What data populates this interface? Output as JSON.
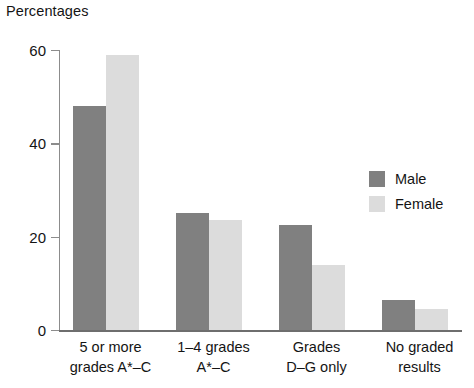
{
  "chart_data": {
    "type": "bar",
    "title": "Percentages",
    "xlabel": "",
    "ylabel": "Percentages",
    "ylim": [
      0,
      60
    ],
    "yticks": [
      0,
      20,
      40,
      60
    ],
    "ytick_labels": [
      "0",
      "20",
      "40",
      "60"
    ],
    "grid": false,
    "legend_position": "right",
    "categories": [
      "5 or more grades A*–C",
      "1–4 grades A*–C",
      "Grades D–G only",
      "No graded results"
    ],
    "category_lines": [
      [
        "5 or more",
        "grades A*–C"
      ],
      [
        "1–4 grades",
        "A*–C"
      ],
      [
        "Grades",
        "D–G only"
      ],
      [
        "No graded",
        "results"
      ]
    ],
    "series": [
      {
        "name": "Male",
        "color": "#808080",
        "values": [
          48,
          25,
          22.5,
          6.5
        ]
      },
      {
        "name": "Female",
        "color": "#dcdcdc",
        "values": [
          59,
          23.5,
          14,
          4.5
        ]
      }
    ]
  },
  "legend": {
    "entries": [
      {
        "label": "Male"
      },
      {
        "label": "Female"
      }
    ]
  },
  "axis": {
    "colors": {
      "axis_line": "#8c8c8c",
      "baseline": "#6e6e6e",
      "text": "#141414"
    }
  }
}
